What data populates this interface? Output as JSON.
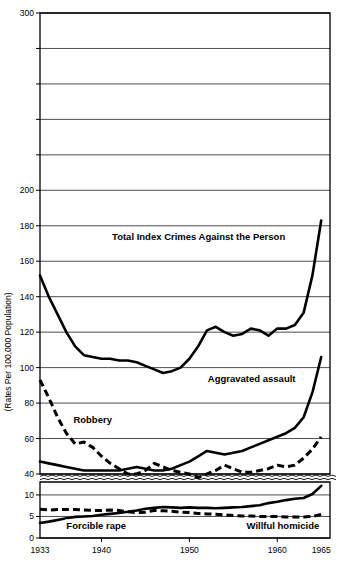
{
  "chart_data": {
    "type": "line",
    "title": "",
    "xlabel": "",
    "ylabel": "(Rates Per 100,000 Population)",
    "grid": true,
    "legend_position": "inline-annotations",
    "x": [
      1933,
      1934,
      1935,
      1936,
      1937,
      1938,
      1939,
      1940,
      1941,
      1942,
      1943,
      1944,
      1945,
      1946,
      1947,
      1948,
      1949,
      1950,
      1951,
      1952,
      1953,
      1954,
      1955,
      1956,
      1957,
      1958,
      1959,
      1960,
      1961,
      1962,
      1963,
      1964,
      1965
    ],
    "xlim": [
      1933,
      1966
    ],
    "xticks": [
      1933,
      1940,
      1950,
      1960,
      1965
    ],
    "xtick_labels": [
      "1933",
      "1940",
      "1950",
      "1960",
      "1965"
    ],
    "upper_panel": {
      "ylim": [
        40,
        300
      ],
      "yticks": [
        40,
        60,
        80,
        100,
        120,
        140,
        160,
        180,
        200,
        220,
        240,
        260,
        280,
        300
      ],
      "ytick_labels": [
        "40",
        "60",
        "80",
        "100",
        "120",
        "140",
        "160",
        "180",
        "200",
        "",
        "",
        "",
        "",
        "300"
      ],
      "gridlines": [
        40,
        60,
        80,
        100,
        120,
        140,
        160,
        180,
        200,
        220,
        240,
        260,
        280,
        300
      ]
    },
    "lower_panel": {
      "ylim": [
        0,
        13
      ],
      "yticks": [
        0,
        5,
        10
      ],
      "ytick_labels": [
        "0",
        "5",
        "10"
      ],
      "gridlines": [
        0,
        5,
        10
      ]
    },
    "axis_break": {
      "between": [
        40,
        13
      ],
      "style": "wavy-double-line"
    },
    "series": [
      {
        "name": "Total Index Crimes Against the Person",
        "style": "solid",
        "panel": "upper",
        "label_position": {
          "x": 1941.2,
          "y": 172
        },
        "values": [
          152,
          140,
          130,
          120,
          112,
          107,
          106,
          105,
          105,
          104,
          104,
          103,
          101,
          99,
          97,
          98,
          100,
          105,
          112,
          121,
          123,
          120,
          118,
          119,
          122,
          121,
          118,
          122,
          122,
          124,
          131,
          152,
          183
        ]
      },
      {
        "name": "Aggravated assault",
        "style": "solid",
        "panel": "upper",
        "label_position": {
          "x": 1952.1,
          "y": 92
        },
        "values": [
          47,
          46,
          45,
          44,
          43,
          42,
          42,
          42,
          42,
          42,
          43,
          44,
          43,
          42,
          42,
          43,
          45,
          47,
          50,
          53,
          52,
          51,
          52,
          53,
          55,
          57,
          59,
          61,
          63,
          66,
          72,
          86,
          106
        ]
      },
      {
        "name": "Robbery",
        "style": "dashed",
        "panel": "upper",
        "label_position": {
          "x": 1936.8,
          "y": 69
        },
        "values": [
          93,
          83,
          72,
          63,
          57,
          58,
          55,
          50,
          46,
          43,
          40,
          40,
          42,
          46,
          44,
          42,
          41,
          40,
          38,
          40,
          42,
          45,
          43,
          41,
          41,
          42,
          43,
          45,
          44,
          45,
          49,
          54,
          61
        ]
      },
      {
        "name": "Forcible rape",
        "style": "solid",
        "panel": "lower",
        "label_position": {
          "x": 1936.0,
          "y": 2.1
        },
        "values": [
          3.5,
          3.8,
          4.2,
          4.6,
          4.9,
          5.0,
          5.1,
          5.4,
          5.6,
          5.8,
          6.1,
          6.4,
          6.8,
          7.0,
          7.2,
          7.1,
          7.0,
          7.1,
          7.0,
          7.0,
          6.9,
          7.0,
          7.1,
          7.2,
          7.4,
          7.6,
          8.1,
          8.4,
          8.8,
          9.1,
          9.3,
          10.2,
          12.1
        ]
      },
      {
        "name": "Willful homicide",
        "style": "dashed",
        "panel": "lower",
        "label_position": {
          "x": 1956.5,
          "y": 2.1
        },
        "values": [
          6.7,
          6.5,
          6.6,
          6.6,
          6.6,
          6.5,
          6.4,
          6.4,
          6.5,
          6.4,
          6.1,
          5.9,
          6.0,
          6.4,
          6.3,
          6.2,
          6.0,
          5.9,
          5.7,
          5.6,
          5.5,
          5.4,
          5.2,
          5.1,
          5.1,
          5.0,
          5.0,
          5.0,
          4.9,
          4.9,
          4.9,
          5.0,
          5.5
        ]
      }
    ]
  }
}
